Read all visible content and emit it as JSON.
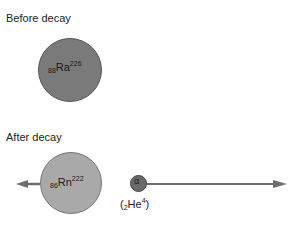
{
  "sections": {
    "before": {
      "title": "Before decay",
      "nucleus": {
        "atomic_number": "88",
        "symbol": "Ra",
        "mass_number": "226",
        "color": "#7a7a7a",
        "border": "#555555"
      }
    },
    "after": {
      "title": "After decay",
      "daughter": {
        "atomic_number": "86",
        "symbol": "Rn",
        "mass_number": "222",
        "color": "#a9a9a9",
        "border": "#777777"
      },
      "alpha": {
        "symbol": "α",
        "color": "#6a6a6a",
        "border": "#444444",
        "label_open": "(",
        "atomic_number": "2",
        "element": "He",
        "mass_number": "4",
        "label_close": ")"
      },
      "arrow_color": "#6e6e6e"
    }
  }
}
